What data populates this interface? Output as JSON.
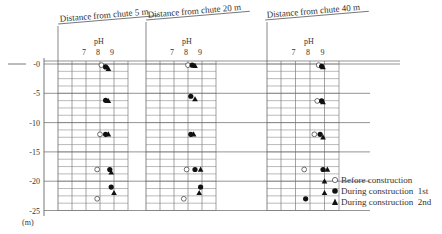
{
  "chart_data": {
    "type": "scatter",
    "title": "",
    "ylabel": "(m)",
    "y_ticks": [
      "-0",
      "-5",
      "-10",
      "-15",
      "-20",
      "-25"
    ],
    "ylim": [
      -25,
      0
    ],
    "x_axis_label": "pH",
    "x_ticks": [
      "7",
      "8",
      "9"
    ],
    "panels": [
      {
        "title": "Distance from chute 5 m",
        "series": [
          {
            "name": "Before construction",
            "marker": "open-circle",
            "points": [
              [
                8.1,
                -0.2
              ],
              [
                8.0,
                -12.0
              ],
              [
                7.8,
                -18.0
              ],
              [
                7.8,
                -23.0
              ]
            ]
          },
          {
            "name": "During construction 1st",
            "marker": "filled-circle",
            "points": [
              [
                8.4,
                -0.5
              ],
              [
                8.4,
                -6.2
              ],
              [
                8.4,
                -12.0
              ],
              [
                8.7,
                -18.0
              ],
              [
                8.8,
                -21.0
              ]
            ]
          },
          {
            "name": "During construction 2nd",
            "marker": "filled-triangle",
            "points": [
              [
                8.6,
                -0.8
              ],
              [
                8.6,
                -6.3
              ],
              [
                8.6,
                -12.0
              ],
              [
                8.8,
                -18.5
              ],
              [
                9.0,
                -22.0
              ]
            ]
          }
        ]
      },
      {
        "title": "Distance from chute 20 m",
        "series": [
          {
            "name": "Before construction",
            "marker": "open-circle",
            "points": [
              [
                8.0,
                -0.2
              ],
              [
                7.9,
                -18.0
              ],
              [
                7.7,
                -23.0
              ]
            ]
          },
          {
            "name": "During construction 1st",
            "marker": "filled-circle",
            "points": [
              [
                8.3,
                -0.2
              ],
              [
                8.2,
                -5.5
              ],
              [
                8.2,
                -12.0
              ],
              [
                8.5,
                -18.0
              ],
              [
                8.9,
                -21.0
              ]
            ]
          },
          {
            "name": "During construction 2nd",
            "marker": "filled-triangle",
            "points": [
              [
                8.5,
                -0.3
              ],
              [
                8.5,
                -6.0
              ],
              [
                8.4,
                -12.0
              ],
              [
                8.9,
                -18.0
              ],
              [
                8.8,
                -22.0
              ]
            ]
          }
        ]
      },
      {
        "title": "Distance from chute 40 m",
        "series": [
          {
            "name": "Before construction",
            "marker": "open-circle",
            "points": [
              [
                8.6,
                -0.2
              ],
              [
                8.5,
                -6.3
              ],
              [
                8.3,
                -12.0
              ],
              [
                7.6,
                -18.0
              ]
            ]
          },
          {
            "name": "During construction 1st",
            "marker": "filled-circle",
            "points": [
              [
                8.8,
                -0.4
              ],
              [
                8.8,
                -6.3
              ],
              [
                8.7,
                -12.0
              ],
              [
                8.9,
                -18.0
              ],
              [
                7.7,
                -23.0
              ]
            ]
          },
          {
            "name": "During construction 2nd",
            "marker": "filled-triangle",
            "points": [
              [
                8.9,
                -0.5
              ],
              [
                8.9,
                -6.5
              ],
              [
                8.9,
                -12.5
              ],
              [
                9.2,
                -18.0
              ],
              [
                9.0,
                -20.0
              ],
              [
                9.0,
                -22.0
              ]
            ]
          }
        ]
      }
    ],
    "legend": [
      {
        "label": "Before construction",
        "marker": "open-circle"
      },
      {
        "label": "During construction  1st",
        "marker": "filled-circle"
      },
      {
        "label": "During construction  2nd",
        "marker": "filled-triangle"
      }
    ],
    "legend_position": "right-bottom",
    "grid": true
  }
}
